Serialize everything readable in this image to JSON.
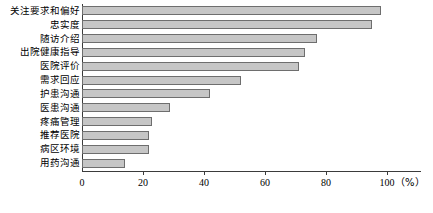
{
  "chart_data": {
    "type": "bar",
    "orientation": "horizontal",
    "title": "",
    "xlabel": "（%）",
    "ylabel": "",
    "xlim": [
      0,
      100
    ],
    "grid": false,
    "legend": null,
    "categories": [
      "关注要求和偏好",
      "忠实度",
      "随访介绍",
      "出院健康指导",
      "医院评价",
      "需求回应",
      "护患沟通",
      "医患沟通",
      "疼痛管理",
      "推荐医院",
      "病区环境",
      "用药沟通"
    ],
    "values": [
      98,
      95,
      77,
      73,
      71,
      52,
      42,
      29,
      23,
      22,
      22,
      14
    ],
    "xticks": [
      0,
      20,
      40,
      60,
      80,
      100
    ],
    "xtick_labels": [
      "0",
      "20",
      "40",
      "60",
      "80",
      "100"
    ],
    "bar_fill_color": "#c6c6c6",
    "bar_border_color": "#6e6e6e",
    "axis_color": "#3b3b3b"
  }
}
